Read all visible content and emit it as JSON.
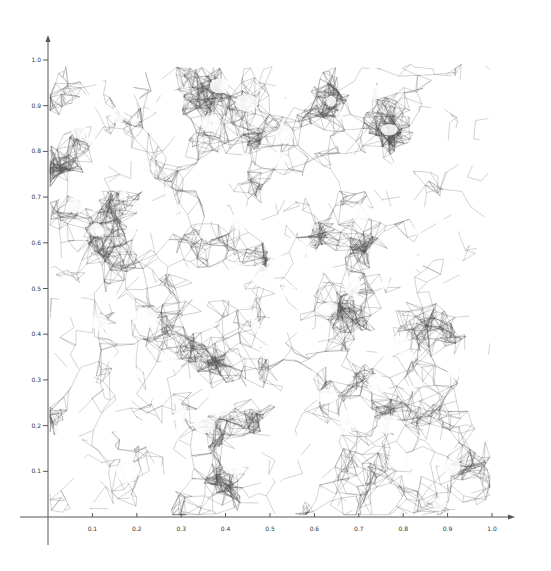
{
  "chart_data": {
    "type": "scatter",
    "subtype": "random-geometric-graph-mesh",
    "title": "",
    "xlabel": "",
    "ylabel": "",
    "xlim": [
      0,
      1.0
    ],
    "ylim": [
      0,
      1.0
    ],
    "grid": false,
    "legend": null,
    "x_ticks": [
      "0.1",
      "0.2",
      "0.3",
      "0.4",
      "0.5",
      "0.6",
      "0.7",
      "0.8",
      "0.9",
      "1.0"
    ],
    "y_ticks": [
      "0.1",
      "0.2",
      "0.3",
      "0.4",
      "0.5",
      "0.6",
      "0.7",
      "0.8",
      "0.9",
      "1.0"
    ],
    "edge_color": "#555555",
    "background": "#ffffff"
  },
  "axes": {
    "color": "#555555",
    "origin_px": [
      48,
      517
    ],
    "x_end_px": 515,
    "y_end_px": 35,
    "x_scale_px": 444,
    "y_scale_px": 457
  },
  "render": {
    "seed": 12345,
    "nodes": 2600,
    "clusters": 140
  }
}
